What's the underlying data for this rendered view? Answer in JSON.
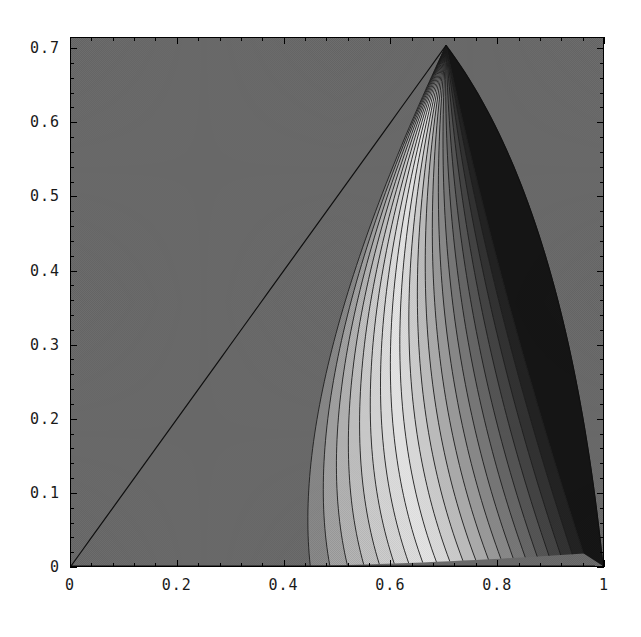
{
  "chart_data": {
    "type": "heatmap",
    "title": "",
    "subtitle": "",
    "xlabel": "",
    "ylabel": "",
    "xlim": [
      0,
      1.0
    ],
    "ylim": [
      0,
      0.7151
    ],
    "grid": false,
    "legend": null,
    "style": "grayscale dithered contour / density plot, Mathematica ContourPlot",
    "x_ticks": [
      {
        "value": 0,
        "label": "0"
      },
      {
        "value": 0.2,
        "label": "0.2"
      },
      {
        "value": 0.4,
        "label": "0.4"
      },
      {
        "value": 0.6,
        "label": "0.6"
      },
      {
        "value": 0.8,
        "label": "0.8"
      },
      {
        "value": 1.0,
        "label": "1"
      }
    ],
    "y_ticks": [
      {
        "value": 0,
        "label": "0"
      },
      {
        "value": 0.1,
        "label": "0.1"
      },
      {
        "value": 0.2,
        "label": "0.2"
      },
      {
        "value": 0.3,
        "label": "0.3"
      },
      {
        "value": 0.4,
        "label": "0.4"
      },
      {
        "value": 0.5,
        "label": "0.5"
      },
      {
        "value": 0.6,
        "label": "0.6"
      },
      {
        "value": 0.7,
        "label": "0.7"
      }
    ],
    "x_minor_count": 4,
    "y_minor_count": 4,
    "background_level_color": "#6e6e6e",
    "frame_color": "#000000",
    "contour_line_color": "#1a1a1a",
    "region": {
      "description": "teardrop / sail shaped high-value region bounded left by the straight diagonal y = x from (0,0) to the apex, and right by a concave curve from the apex down to (1, 0)",
      "apex": [
        0.705,
        0.705
      ],
      "left_boundary": "straight line y = x from (0,0) to (0.705,0.705)",
      "right_boundary": "curve from apex (0.705,0.705) through (0.82,0.45), (0.90,0.27), (0.955,0.12) to (1.0,0.0)",
      "focus": [
        0.985,
        0.018
      ]
    },
    "levels": [
      {
        "index": 0,
        "gray": "#6e6e6e"
      },
      {
        "index": 1,
        "gray": "#8c8c8c"
      },
      {
        "index": 2,
        "gray": "#a6a6a6"
      },
      {
        "index": 3,
        "gray": "#b8b8b8"
      },
      {
        "index": 4,
        "gray": "#c6c6c6"
      },
      {
        "index": 5,
        "gray": "#d2d2d2"
      },
      {
        "index": 6,
        "gray": "#dcdcdc"
      },
      {
        "index": 7,
        "gray": "#e4e4e4"
      },
      {
        "index": 8,
        "gray": "#ececec"
      },
      {
        "index": 9,
        "gray": "#e2e2e2"
      },
      {
        "index": 10,
        "gray": "#d4d4d4"
      },
      {
        "index": 11,
        "gray": "#c4c4c4"
      },
      {
        "index": 12,
        "gray": "#b2b2b2"
      },
      {
        "index": 13,
        "gray": "#a0a0a0"
      },
      {
        "index": 14,
        "gray": "#8e8e8e"
      },
      {
        "index": 15,
        "gray": "#7c7c7c"
      },
      {
        "index": 16,
        "gray": "#6a6a6a"
      },
      {
        "index": 17,
        "gray": "#585858"
      },
      {
        "index": 18,
        "gray": "#464646"
      },
      {
        "index": 19,
        "gray": "#343434"
      },
      {
        "index": 20,
        "gray": "#242424"
      },
      {
        "index": 21,
        "gray": "#161616"
      }
    ],
    "contour_count": 22
  }
}
